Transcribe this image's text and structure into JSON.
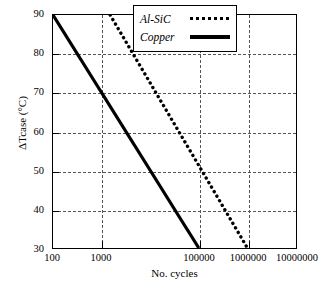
{
  "chart_data": {
    "type": "line",
    "title": "",
    "xlabel": "No. cycles",
    "ylabel": "ΔTcase (°C)",
    "xscale": "log",
    "xlim": [
      100,
      10000000
    ],
    "ylim": [
      30,
      90
    ],
    "grid": true,
    "legend_position": "top-right",
    "x_ticks": [
      {
        "value": 100,
        "label": "100"
      },
      {
        "value": 1000,
        "label": "1000"
      },
      {
        "value": 100000,
        "label": "100000"
      },
      {
        "value": 1000000,
        "label": "1000000"
      },
      {
        "value": 10000000,
        "label": "10000000"
      }
    ],
    "y_ticks": [
      {
        "value": 30,
        "label": "30"
      },
      {
        "value": 40,
        "label": "40"
      },
      {
        "value": 50,
        "label": "50"
      },
      {
        "value": 60,
        "label": "60"
      },
      {
        "value": 70,
        "label": "70"
      },
      {
        "value": 80,
        "label": "80"
      },
      {
        "value": 90,
        "label": "90"
      }
    ],
    "series": [
      {
        "name": "Al-SiC",
        "style": "dotted",
        "color": "#000000",
        "points": [
          {
            "x": 1500,
            "y": 90
          },
          {
            "x": 1000000,
            "y": 30
          }
        ]
      },
      {
        "name": "Copper",
        "style": "solid",
        "color": "#000000",
        "points": [
          {
            "x": 100,
            "y": 90
          },
          {
            "x": 100000,
            "y": 30
          }
        ]
      }
    ]
  },
  "legend": {
    "items": [
      {
        "label": "Al-SiC",
        "style": "dotted"
      },
      {
        "label": "Copper",
        "style": "solid"
      }
    ]
  }
}
